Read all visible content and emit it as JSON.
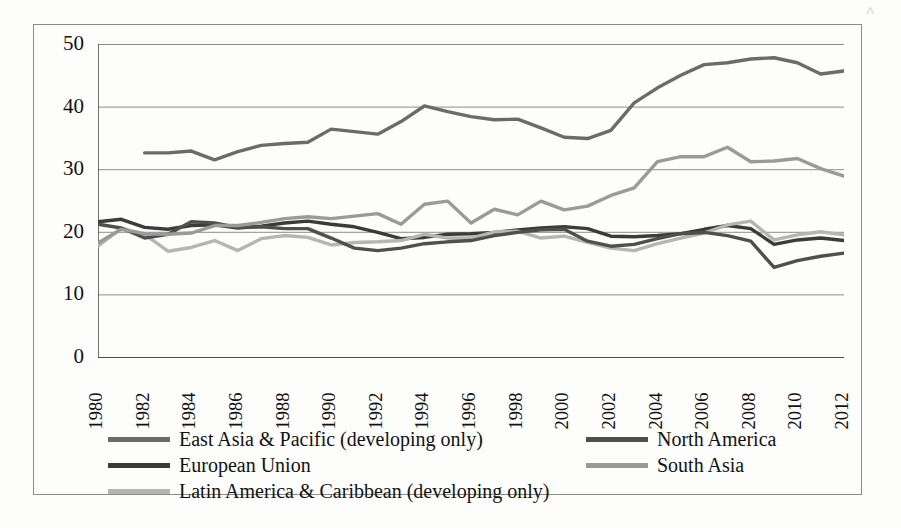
{
  "chart_data": {
    "type": "line",
    "title": "",
    "subtitle": "",
    "xlabel": "",
    "ylabel": "",
    "xlim": [
      1980,
      2012
    ],
    "ylim": [
      0,
      50
    ],
    "yticks": [
      0,
      10,
      20,
      30,
      40,
      50
    ],
    "grid": true,
    "grid_axis": "y",
    "legend_position": "bottom",
    "legend_columns": 2,
    "x": [
      1980,
      1981,
      1982,
      1983,
      1984,
      1985,
      1986,
      1987,
      1988,
      1989,
      1990,
      1991,
      1992,
      1993,
      1994,
      1995,
      1996,
      1997,
      1998,
      1999,
      2000,
      2001,
      2002,
      2003,
      2004,
      2005,
      2006,
      2007,
      2008,
      2009,
      2010,
      2011,
      2012
    ],
    "xtick_labels": [
      "1980",
      "1982",
      "1984",
      "1986",
      "1988",
      "1990",
      "1992",
      "1994",
      "1996",
      "1998",
      "2000",
      "2002",
      "2004",
      "2006",
      "2008",
      "2010",
      "2012"
    ],
    "series": [
      {
        "name": "East Asia & Pacific (developing only)",
        "color": "#6b6b6b",
        "values": [
          null,
          null,
          32.6,
          32.6,
          32.9,
          31.5,
          32.8,
          33.8,
          34.1,
          34.3,
          36.4,
          36.0,
          35.6,
          37.6,
          40.1,
          39.2,
          38.4,
          37.9,
          38.0,
          36.6,
          35.1,
          34.9,
          36.2,
          40.6,
          43.0,
          45.0,
          46.7,
          47.0,
          47.6,
          47.8,
          47.0,
          45.2,
          45.7
        ]
      },
      {
        "name": "European Union",
        "color": "#3b3b3b",
        "values": [
          21.6,
          22.0,
          20.7,
          20.4,
          21.0,
          21.1,
          20.6,
          20.9,
          21.4,
          21.7,
          21.2,
          20.8,
          19.9,
          18.9,
          19.1,
          19.6,
          19.7,
          19.9,
          20.3,
          20.6,
          20.8,
          20.5,
          19.3,
          19.2,
          19.4,
          19.7,
          20.4,
          21.0,
          20.5,
          18.0,
          18.7,
          19.0,
          18.6
        ]
      },
      {
        "name": "Latin America & Caribbean (developing only)",
        "color": "#b5b5b5",
        "values": [
          17.7,
          20.6,
          19.6,
          16.9,
          17.5,
          18.6,
          17.0,
          18.9,
          19.4,
          19.1,
          17.9,
          18.3,
          18.4,
          18.6,
          19.6,
          19.0,
          19.0,
          20.0,
          20.1,
          19.0,
          19.3,
          18.3,
          17.4,
          17.0,
          18.1,
          19.0,
          19.8,
          21.1,
          21.7,
          18.7,
          19.5,
          20.0,
          19.5
        ]
      },
      {
        "name": "North America",
        "color": "#4f4f4f",
        "values": [
          21.2,
          20.6,
          19.0,
          19.6,
          21.6,
          21.4,
          20.7,
          20.8,
          20.5,
          20.5,
          19.0,
          17.4,
          17.0,
          17.4,
          18.1,
          18.4,
          18.6,
          19.4,
          19.9,
          20.3,
          20.4,
          18.5,
          17.7,
          18.0,
          18.9,
          19.7,
          19.9,
          19.4,
          18.5,
          14.3,
          15.4,
          16.1,
          16.6
        ]
      },
      {
        "name": "South Asia",
        "color": "#9a9a9a",
        "values": [
          18.2,
          20.4,
          19.7,
          19.6,
          19.8,
          21.0,
          21.0,
          21.5,
          22.1,
          22.4,
          22.1,
          22.5,
          22.9,
          21.2,
          24.4,
          24.9,
          21.4,
          23.6,
          22.7,
          24.9,
          23.5,
          24.1,
          25.8,
          27.0,
          31.2,
          32.0,
          32.0,
          33.5,
          31.2,
          31.3,
          31.7,
          30.1,
          28.9
        ]
      }
    ]
  },
  "legend": {
    "items": [
      {
        "label": "East Asia & Pacific (developing only)",
        "color": "#6b6b6b"
      },
      {
        "label": "European Union",
        "color": "#3b3b3b"
      },
      {
        "label": "Latin America & Caribbean (developing only)",
        "color": "#b5b5b5"
      },
      {
        "label": "North America",
        "color": "#4f4f4f"
      },
      {
        "label": "South Asia",
        "color": "#9a9a9a"
      }
    ]
  },
  "artifact": {
    "mark": "˄"
  }
}
